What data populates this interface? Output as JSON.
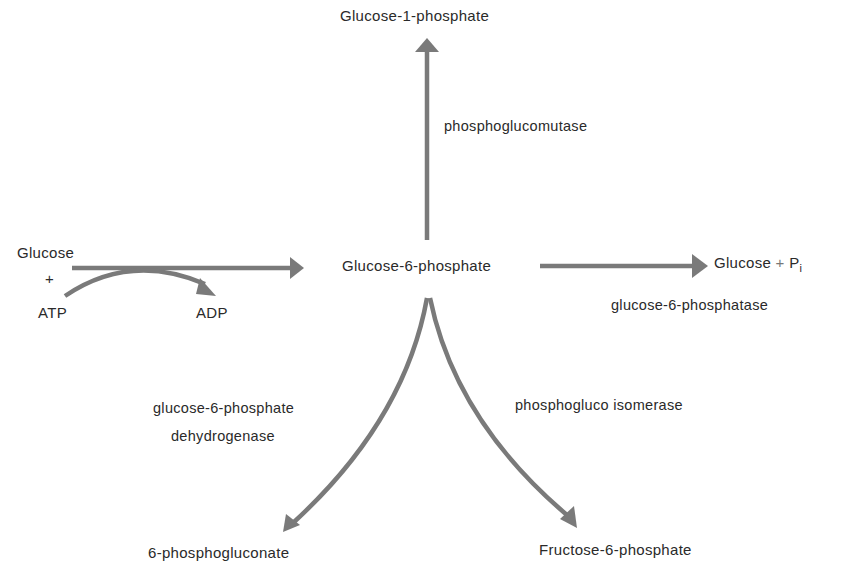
{
  "diagram": {
    "type": "metabolic-pathway",
    "arrow_color": "#7a7a7a",
    "nodes": {
      "center": "Glucose-6-phosphate",
      "top": "Glucose-1-phosphate",
      "left_glucose": "Glucose",
      "left_plus": "+",
      "left_atp": "ATP",
      "left_adp": "ADP",
      "right_glucose": "Glucose",
      "right_plus": "+",
      "right_pi": "P",
      "right_pi_sub": "i",
      "bottom_left": "6-phosphogluconate",
      "bottom_right": "Fructose-6-phosphate"
    },
    "enzymes": {
      "top": "phosphoglucomutase",
      "right": "glucose-6-phosphatase",
      "bottom_left_line1": "glucose-6-phosphate",
      "bottom_left_line2": "dehydrogenase",
      "bottom_right": "phosphogluco isomerase"
    }
  }
}
